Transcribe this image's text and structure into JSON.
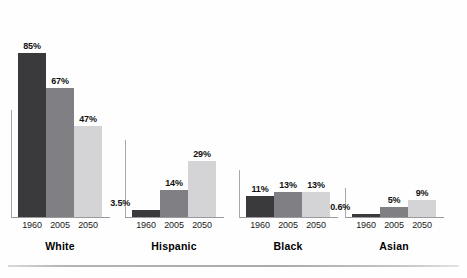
{
  "chart_data": {
    "type": "bar",
    "title": "",
    "subtitle": "",
    "xlabel": "",
    "ylabel": "",
    "ylim": [
      0,
      100
    ],
    "grid": false,
    "legend_position": "none",
    "categories": [
      "White",
      "Hispanic",
      "Black",
      "Asian"
    ],
    "series": [
      {
        "name": "1960",
        "values": [
          85,
          3.5,
          11,
          0.6
        ],
        "color": "#3a3a3c"
      },
      {
        "name": "2005",
        "values": [
          67,
          14,
          13,
          5
        ],
        "color": "#808084"
      },
      {
        "name": "2050",
        "values": [
          47,
          29,
          13,
          9
        ],
        "color": "#d4d4d6"
      }
    ],
    "value_labels": [
      [
        "85%",
        "67%",
        "47%"
      ],
      [
        "3.5%",
        "14%",
        "29%"
      ],
      [
        "11%",
        "13%",
        "13%"
      ],
      [
        "0.6%",
        "5%",
        "9%"
      ]
    ],
    "year_ticks": [
      "1960",
      "2005",
      "2050"
    ]
  },
  "groups": [
    {
      "category": "White",
      "bars": [
        {
          "year": "1960",
          "value": 85,
          "label": "85%",
          "tone": "y1960"
        },
        {
          "year": "2005",
          "value": 67,
          "label": "67%",
          "tone": "y2005"
        },
        {
          "year": "2050",
          "value": 47,
          "label": "47%",
          "tone": "y2050"
        }
      ]
    },
    {
      "category": "Hispanic",
      "bars": [
        {
          "year": "1960",
          "value": 3.5,
          "label": "3.5%",
          "tone": "y1960"
        },
        {
          "year": "2005",
          "value": 14,
          "label": "14%",
          "tone": "y2005"
        },
        {
          "year": "2050",
          "value": 29,
          "label": "29%",
          "tone": "y2050"
        }
      ]
    },
    {
      "category": "Black",
      "bars": [
        {
          "year": "1960",
          "value": 11,
          "label": "11%",
          "tone": "y1960"
        },
        {
          "year": "2005",
          "value": 13,
          "label": "13%",
          "tone": "y2005"
        },
        {
          "year": "2050",
          "value": 13,
          "label": "13%",
          "tone": "y2050"
        }
      ]
    },
    {
      "category": "Asian",
      "bars": [
        {
          "year": "1960",
          "value": 0.6,
          "label": "0.6%",
          "tone": "y1960"
        },
        {
          "year": "2005",
          "value": 5,
          "label": "5%",
          "tone": "y2005"
        },
        {
          "year": "2050",
          "value": 9,
          "label": "9%",
          "tone": "y2050"
        }
      ]
    }
  ],
  "colors": {
    "bar_1960": "#3a3a3c",
    "bar_2005": "#808084",
    "bar_2050": "#d4d4d6",
    "axis": "#9a9a9e",
    "text": "#111111",
    "background": "#fefefe"
  }
}
